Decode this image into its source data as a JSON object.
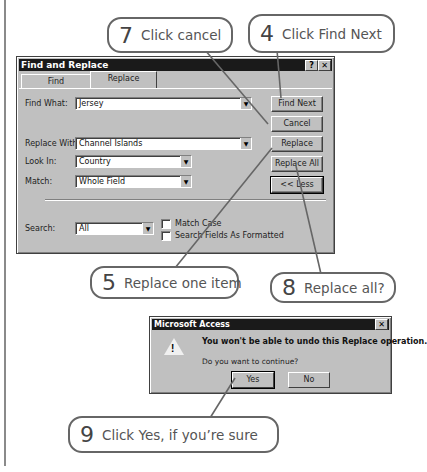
{
  "page": {
    "top_text_fragment": "tep s up",
    "colors": {
      "callout_border": "#666666",
      "dialog_face": "#c0c0c0",
      "titlebar": "#1a1a1a"
    }
  },
  "find_replace_dialog": {
    "title": "Find and Replace",
    "help_button": "?",
    "close_button": "✕",
    "tabs": [
      {
        "label": "Find",
        "active": false
      },
      {
        "label": "Replace",
        "active": true
      }
    ],
    "find_what": {
      "label": "Find What:",
      "value": "Jersey"
    },
    "replace_with": {
      "label": "Replace With:",
      "value": "Channel Islands"
    },
    "look_in": {
      "label": "Look In:",
      "value": "Country"
    },
    "match": {
      "label": "Match:",
      "value": "Whole Field"
    },
    "search": {
      "label": "Search:",
      "value": "All"
    },
    "match_case": {
      "label": "Match Case",
      "checked": false
    },
    "search_formatted": {
      "label": "Search Fields As Formatted",
      "checked": false
    },
    "buttons": {
      "find_next": "Find Next",
      "cancel": "Cancel",
      "replace": "Replace",
      "replace_all": "Replace All",
      "less": "<< Less"
    }
  },
  "access_dialog": {
    "title": "Microsoft Access",
    "close_button": "✕",
    "icon": "warning-icon",
    "message": "You won't be able to undo this Replace operation.",
    "question": "Do you want to continue?",
    "buttons": {
      "yes": "Yes",
      "no": "No"
    }
  },
  "callouts": [
    {
      "id": "7",
      "number": "7",
      "text": "Click cancel"
    },
    {
      "id": "4",
      "number": "4",
      "text": "Click Find Next"
    },
    {
      "id": "5",
      "number": "5",
      "text": "Replace one item"
    },
    {
      "id": "8",
      "number": "8",
      "text": "Replace all?"
    },
    {
      "id": "9",
      "number": "9",
      "text": "Click Yes, if you’re sure"
    }
  ]
}
